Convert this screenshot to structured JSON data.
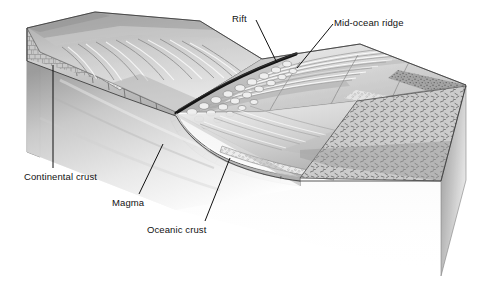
{
  "figure": {
    "type": "geological-block-diagram",
    "background_color": "#ffffff",
    "ink_color": "#111111"
  },
  "labels": {
    "rift": "Rift",
    "mid_ocean_ridge": "Mid-ocean ridge",
    "continental_crust": "Continental crust",
    "magma": "Magma",
    "oceanic_crust": "Oceanic crust"
  },
  "features": {
    "rift_note": "dark axial fissure along the ridge crest",
    "pillow_lava_note": "rounded pillow-lava blobs flanking the rift",
    "continental_shelf_note": "ridged and furrowed continental slope on the left block",
    "sediment_note": "stippled sediment wedge at the continental margin",
    "basalt_hatch_note": "dash hatching on the oceanic crust cross-section face"
  },
  "palette": {
    "paper": "#ffffff",
    "line": "#1a1a1a",
    "light_gray": "#e3e3e3",
    "mid_gray": "#b9b9b9",
    "dark_gray": "#8d8d8d",
    "deep_gray": "#6a6a6a",
    "shadow_gray": "#d6d6d6",
    "crust_gray": "#c4c4c4"
  }
}
